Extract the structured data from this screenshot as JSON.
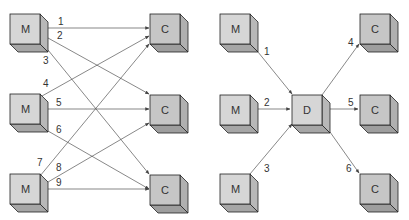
{
  "diagram": {
    "left": {
      "description": "Point-to-point connections: each manufacturer to each customer",
      "nodes": [
        {
          "id": "m1",
          "label": "M",
          "x": 10,
          "y": 14
        },
        {
          "id": "m2",
          "label": "M",
          "x": 10,
          "y": 95
        },
        {
          "id": "m3",
          "label": "M",
          "x": 10,
          "y": 174
        },
        {
          "id": "c1",
          "label": "C",
          "x": 150,
          "y": 14
        },
        {
          "id": "c2",
          "label": "C",
          "x": 150,
          "y": 96
        },
        {
          "id": "c3",
          "label": "C",
          "x": 150,
          "y": 175
        }
      ],
      "edges": [
        {
          "label": "1",
          "from": "m1",
          "to": "c1"
        },
        {
          "label": "2",
          "from": "m1",
          "to": "c2"
        },
        {
          "label": "3",
          "from": "m1",
          "to": "c3"
        },
        {
          "label": "4",
          "from": "m2",
          "to": "c1"
        },
        {
          "label": "5",
          "from": "m2",
          "to": "c2"
        },
        {
          "label": "6",
          "from": "m2",
          "to": "c3"
        },
        {
          "label": "7",
          "from": "m3",
          "to": "c1"
        },
        {
          "label": "8",
          "from": "m3",
          "to": "c2"
        },
        {
          "label": "9",
          "from": "m3",
          "to": "c3"
        }
      ]
    },
    "right": {
      "description": "Connections through a distributor",
      "nodes": [
        {
          "id": "m1",
          "label": "M",
          "x": 220,
          "y": 14
        },
        {
          "id": "m2",
          "label": "M",
          "x": 220,
          "y": 95
        },
        {
          "id": "m3",
          "label": "M",
          "x": 220,
          "y": 174
        },
        {
          "id": "d",
          "label": "D",
          "x": 292,
          "y": 95
        },
        {
          "id": "c1",
          "label": "C",
          "x": 360,
          "y": 14
        },
        {
          "id": "c2",
          "label": "C",
          "x": 360,
          "y": 95
        },
        {
          "id": "c3",
          "label": "C",
          "x": 360,
          "y": 174
        }
      ],
      "edges": [
        {
          "label": "1",
          "from": "m1",
          "to": "d"
        },
        {
          "label": "2",
          "from": "m2",
          "to": "d"
        },
        {
          "label": "3",
          "from": "m3",
          "to": "d"
        },
        {
          "label": "4",
          "from": "d",
          "to": "c1"
        },
        {
          "label": "5",
          "from": "d",
          "to": "c2"
        },
        {
          "label": "6",
          "from": "d",
          "to": "c3"
        }
      ]
    },
    "colors": {
      "front_face": "#d4d4d4",
      "side_face": "#b8b8b8",
      "bottom_face": "#a8a8a8",
      "customer_front": "#c4c4c4",
      "stroke": "#222222",
      "arrow": "#555555"
    }
  },
  "labels": {
    "m": "M",
    "c": "C",
    "d": "D",
    "e1": "1",
    "e2": "2",
    "e3": "3",
    "e4": "4",
    "e5": "5",
    "e6": "6",
    "e7": "7",
    "e8": "8",
    "e9": "9"
  }
}
